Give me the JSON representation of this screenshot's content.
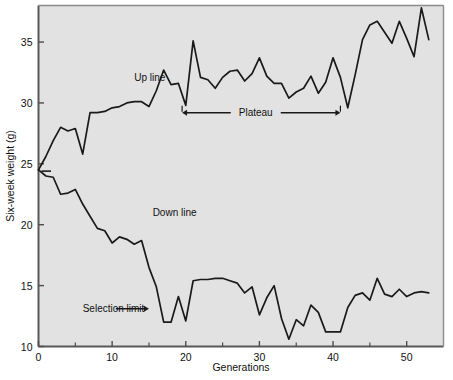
{
  "chart_data": {
    "type": "line",
    "title": "",
    "xlabel": "Generations",
    "ylabel": "Six-week weight  (g)",
    "xlim": [
      0,
      55
    ],
    "ylim": [
      10,
      38
    ],
    "xticks": [
      0,
      10,
      20,
      30,
      40,
      50
    ],
    "xticks_minor": [
      5,
      15,
      25,
      35,
      45
    ],
    "yticks": [
      10,
      15,
      20,
      25,
      30,
      35
    ],
    "grid": false,
    "legend": "none",
    "plot_background": "#e2e2e2",
    "line_color": "#1a1a1a",
    "frame_color": "#4d4d4d",
    "annotations": [
      {
        "id": "up-line-label",
        "text": "Up line",
        "x": 13.0,
        "y": 31.8
      },
      {
        "id": "down-line-label",
        "text": "Down line",
        "x": 15.5,
        "y": 20.7
      },
      {
        "id": "selection-limit-label",
        "text": "Selection limit",
        "x": 6.0,
        "y": 13.1
      },
      {
        "id": "plateau-label",
        "text": "Plateau",
        "x": 29.5,
        "y": 29.2
      }
    ],
    "series": [
      {
        "name": "Up line",
        "x": [
          0,
          1,
          2,
          3,
          4,
          5,
          6,
          7,
          8,
          9,
          10,
          11,
          12,
          13,
          14,
          15,
          16,
          17,
          18,
          19,
          20,
          21,
          22,
          23,
          24,
          25,
          26,
          27,
          28,
          29,
          30,
          31,
          32,
          33,
          34,
          35,
          36,
          37,
          38,
          39,
          40,
          41,
          42,
          43,
          44,
          45,
          46,
          47,
          48,
          49,
          50,
          51,
          52,
          53
        ],
        "values": [
          24.5,
          25.6,
          26.9,
          28.0,
          27.7,
          27.9,
          25.8,
          29.2,
          29.2,
          29.3,
          29.6,
          29.7,
          30.0,
          30.1,
          30.1,
          29.7,
          31.0,
          32.7,
          31.5,
          31.6,
          29.8,
          35.1,
          32.1,
          31.9,
          31.2,
          32.1,
          32.6,
          32.7,
          31.8,
          32.4,
          33.7,
          32.2,
          31.6,
          31.6,
          30.4,
          30.9,
          31.2,
          32.2,
          30.8,
          31.7,
          33.7,
          32.1,
          29.6,
          32.3,
          35.2,
          36.4,
          36.7,
          35.8,
          34.9,
          36.7,
          35.3,
          33.8,
          37.8,
          35.2
        ]
      },
      {
        "name": "Down line",
        "x": [
          0,
          1,
          2,
          3,
          4,
          5,
          6,
          7,
          8,
          9,
          10,
          11,
          12,
          13,
          14,
          15,
          16,
          17,
          18,
          19,
          20,
          21,
          22,
          23,
          24,
          25,
          26,
          27,
          28,
          29,
          30,
          31,
          32,
          33,
          34,
          35,
          36,
          37,
          38,
          39,
          40,
          41,
          42,
          43,
          44,
          45,
          46,
          47,
          48,
          49,
          50,
          51,
          52,
          53
        ],
        "values": [
          24.5,
          24.0,
          23.9,
          22.5,
          22.6,
          22.9,
          21.7,
          20.7,
          19.7,
          19.5,
          18.5,
          19.0,
          18.8,
          18.4,
          18.7,
          16.5,
          14.9,
          12.0,
          12.0,
          14.1,
          12.1,
          15.4,
          15.5,
          15.5,
          15.6,
          15.6,
          15.4,
          15.2,
          14.4,
          14.9,
          12.6,
          14.0,
          15.0,
          12.3,
          10.6,
          12.2,
          11.7,
          13.4,
          12.8,
          11.2,
          11.2,
          11.2,
          13.2,
          14.2,
          14.4,
          13.8,
          15.6,
          14.3,
          14.1,
          14.7,
          14.1,
          14.4,
          14.5,
          14.4
        ]
      }
    ],
    "plateau_marker": {
      "x_start": 19.5,
      "x_end": 41.0,
      "y": 29.2
    },
    "selection_limit_arrow": {
      "x_start": 10.5,
      "x_end": 15.0,
      "y": 13.1
    },
    "start_tick_marker": {
      "x_start": 0.4,
      "x_end": 1.7,
      "y": 24.4
    }
  }
}
